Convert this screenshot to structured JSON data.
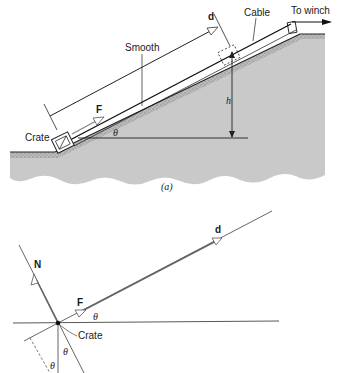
{
  "figure_a": {
    "caption": "(a)",
    "labels": {
      "smooth": "Smooth",
      "cable": "Cable",
      "to_winch": "To winch",
      "crate": "Crate",
      "force": "F",
      "displacement": "d",
      "height": "h",
      "angle": "θ"
    }
  },
  "figure_b": {
    "labels": {
      "normal": "N",
      "force": "F",
      "displacement": "d",
      "crate": "Crate",
      "angle_top": "θ",
      "angle_mid": "θ",
      "angle_low": "θ"
    }
  },
  "colors": {
    "ground": "#c8c8c8",
    "ground_edge": "#9a9a9a",
    "line": "#2a2a2a",
    "vector_line": "#555555"
  }
}
